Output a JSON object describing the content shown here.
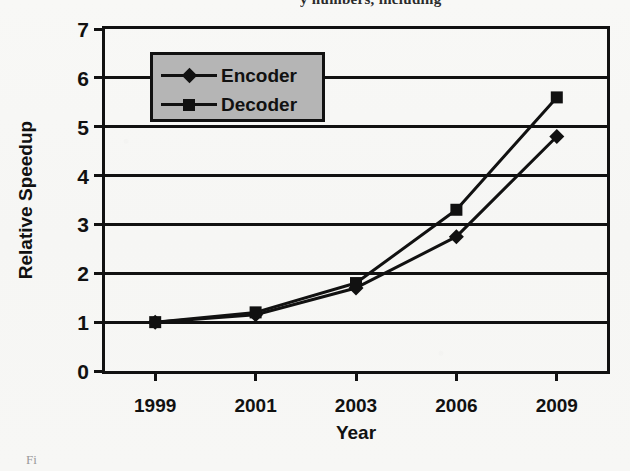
{
  "page": {
    "top_text_fragment": "y numbers, including",
    "caption_stub": "Fi"
  },
  "chart_data": {
    "type": "line",
    "title": "",
    "xlabel": "Year",
    "ylabel": "Relative Speedup",
    "categories": [
      "1999",
      "2001",
      "2003",
      "2006",
      "2009"
    ],
    "series": [
      {
        "name": "Encoder",
        "marker": "diamond",
        "values": [
          1.0,
          1.15,
          1.7,
          2.75,
          4.8
        ]
      },
      {
        "name": "Decoder",
        "marker": "square",
        "values": [
          1.0,
          1.2,
          1.8,
          3.3,
          5.6
        ]
      }
    ],
    "ylim": [
      0,
      7
    ],
    "yticks": [
      0,
      1,
      2,
      3,
      4,
      5,
      6,
      7
    ],
    "ytick_labels": [
      "0",
      "1",
      "2",
      "3",
      "4",
      "5",
      "6",
      "7"
    ],
    "grid": true,
    "grid_axis": "y",
    "legend_position": "upper-left-inside",
    "colors": {
      "line": "#111111",
      "marker": "#111111",
      "legend_background": "#b5b5b5",
      "axis": "#111111",
      "plot_background": "#f7f7f5"
    }
  }
}
